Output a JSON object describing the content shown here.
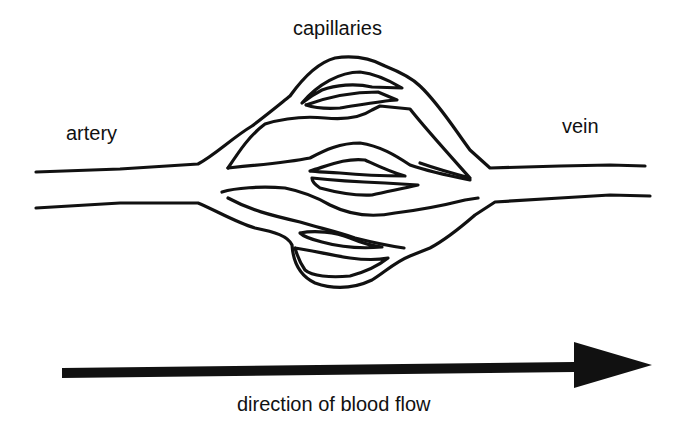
{
  "diagram": {
    "type": "anatomical-line-drawing",
    "labels": {
      "capillaries": "capillaries",
      "artery": "artery",
      "vein": "vein",
      "flow": "direction of blood flow"
    },
    "arrow": {
      "direction": "right",
      "meaning": "direction of blood flow"
    },
    "colors": {
      "stroke": "#111111",
      "background": "#ffffff"
    }
  }
}
